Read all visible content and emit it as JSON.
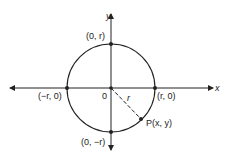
{
  "diagram": {
    "title": "",
    "axes": {
      "x_label": "x",
      "y_label": "y"
    },
    "origin_label": "0",
    "radius_label": "r",
    "points": {
      "top": "(0, r)",
      "bottom": "(0, −r)",
      "left": "(−r, 0)",
      "right": "(r, 0)",
      "p": "P(x, y)"
    },
    "colors": {
      "stroke": "#222222",
      "background": "#ffffff"
    }
  }
}
